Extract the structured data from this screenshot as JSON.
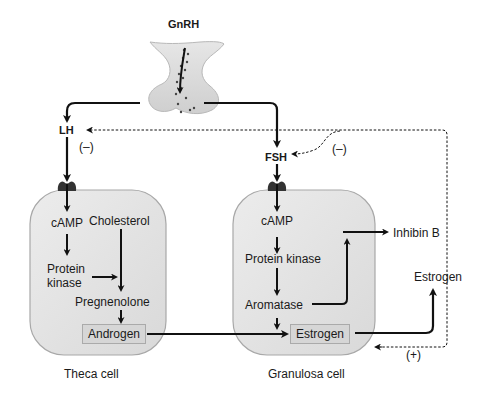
{
  "diagram": {
    "colors": {
      "cell_fill": "#e2e2e2",
      "cell_stroke": "#a8a8a8",
      "pituitary_fill": "#d8d8d8",
      "receptor": "#333333",
      "arrow": "#111111",
      "box_fill": "#d6d6d6"
    },
    "top": {
      "gnrh": "GnRH",
      "lh": "LH",
      "fsh": "FSH",
      "lh_feedback": "(–)",
      "fsh_feedback": "(–)"
    },
    "theca_cell": {
      "caption": "Theca cell",
      "camp": "cAMP",
      "cholesterol": "Cholesterol",
      "protein_kinase_line1": "Protein",
      "protein_kinase_line2": "kinase",
      "pregnenolone": "Pregnenolone",
      "androgen": "Androgen"
    },
    "granulosa_cell": {
      "caption": "Granulosa cell",
      "camp": "cAMP",
      "protein_kinase": "Protein kinase",
      "aromatase": "Aromatase",
      "estrogen": "Estrogen"
    },
    "outputs": {
      "inhibin_b": "Inhibin B",
      "estrogen": "Estrogen",
      "estrogen_feedback": "(+)"
    }
  }
}
